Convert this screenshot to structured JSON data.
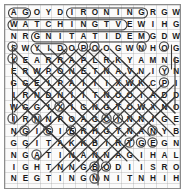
{
  "puzzle": {
    "kind": "word-search",
    "rows": 15,
    "cols": 15,
    "cell_px": 11.6,
    "ink_color": "#1b1b1b",
    "mark_color": "#3a3a3a",
    "frame_color": "#8c8c8c",
    "paper_color": "#fbfbfb",
    "grid": [
      [
        "A",
        "G",
        "O",
        "Y",
        "D",
        "I",
        "R",
        "O",
        "N",
        "I",
        "N",
        "G",
        "R",
        "G",
        "W"
      ],
      [
        "W",
        "A",
        "T",
        "C",
        "H",
        "I",
        "N",
        "G",
        "T",
        "V",
        "E",
        "W",
        "I",
        "H",
        "G"
      ],
      [
        "N",
        "R",
        "G",
        "N",
        "I",
        "T",
        "A",
        "T",
        "I",
        "D",
        "E",
        "M",
        "G",
        "D",
        "W"
      ],
      [
        "S",
        "W",
        "Y",
        "I",
        "D",
        "O",
        "P",
        "O",
        "O",
        "G",
        "W",
        "N",
        "H",
        "O",
        "G"
      ],
      [
        "Y",
        "E",
        "A",
        "R",
        "R",
        "A",
        "P",
        "L",
        "R",
        "K",
        "Y",
        "A",
        "M",
        "N",
        "G"
      ],
      [
        "E",
        "R",
        "W",
        "P",
        "O",
        "N",
        "E",
        "T",
        "N",
        "A",
        "V",
        "N",
        "I",
        "Y",
        "N"
      ],
      [
        "G",
        "G",
        "E",
        "I",
        "P",
        "A",
        "I",
        "I",
        "I",
        "X",
        "W",
        "K",
        "C",
        "P",
        "I"
      ],
      [
        "I",
        "R",
        "N",
        "D",
        "N",
        "I",
        "I",
        "T",
        "N",
        "O",
        "O",
        "I",
        "A",
        "D",
        "D"
      ],
      [
        "W",
        "G",
        "G",
        "I",
        "X",
        "I",
        "G",
        "N",
        "G",
        "T",
        "O",
        "W",
        "X",
        "N",
        "O"
      ],
      [
        "I",
        "R",
        "N",
        "N",
        "P",
        "O",
        "A",
        "G",
        "C",
        "I",
        "N",
        "N",
        "I",
        "G",
        "E"
      ],
      [
        "N",
        "G",
        "I",
        "G",
        "I",
        "E",
        "R",
        "H",
        "G",
        "T",
        "N",
        "A",
        "N",
        "Y",
        "B"
      ],
      [
        "G",
        "G",
        "I",
        "T",
        "A",
        "K",
        "K",
        "B",
        "I",
        "R",
        "T",
        "G",
        "E",
        "G",
        "N"
      ],
      [
        "N",
        "G",
        "A",
        "T",
        "I",
        "N",
        "A",
        "N",
        "N",
        "A",
        "G",
        "I",
        "H",
        "A",
        "L"
      ],
      [
        "I",
        "G",
        "H",
        "T",
        "N",
        "N",
        "G",
        "B",
        "O",
        "D",
        "I",
        "I",
        "S",
        "R",
        "O"
      ],
      [
        "N",
        "E",
        "G",
        "T",
        "I",
        "N",
        "G",
        "N",
        "N",
        "I",
        "T",
        "N",
        "H",
        "I",
        "H"
      ]
    ],
    "row_labels": [
      "A G O Y D I R O N I N G R G W",
      "W A T C H I N G T V E W I H G",
      "N R G N I T A T I D E M G D W",
      "S W Y I D O P O O G W N H O G",
      "Y E A R R A P L R K Y A M N G",
      "E R W P O N E T N A V N I Y N",
      "G G E I P A I I I X W K C P I",
      "I R N D N I I T N O O I A D D",
      "W G G I X I G N G T O W X N O",
      "I R N N P O A G C I N N I G E",
      "N G I G I E R H G T N A N Y B",
      "G G I T A K K B I R T G E G N",
      "N G A T I N A N N A G I H A L",
      "I G H T N N G B O D I I S R O",
      "N E G T I N G N N I T N H I H"
    ],
    "found_words": [
      {
        "text": "IRONING",
        "direction": "horizontal",
        "row": 1,
        "start_col": 6,
        "end_col": 12
      },
      {
        "text": "WATCHINGTV",
        "direction": "horizontal",
        "row": 2,
        "start_col": 1,
        "end_col": 10
      },
      {
        "text": "MEDITATING",
        "direction": "horizontal-rev",
        "row": 3,
        "start_col": 12,
        "end_col": 3
      },
      {
        "text": "YID",
        "direction": "horizontal",
        "row": 4,
        "start_col": 3,
        "end_col": 5
      }
    ]
  }
}
